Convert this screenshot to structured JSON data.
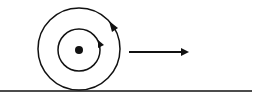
{
  "diagram": {
    "type": "rolling-wheel",
    "stroke_color": "#111111",
    "background": "#ffffff",
    "ground": {
      "x1": 0,
      "x2": 252,
      "y": 91
    },
    "outer_circle": {
      "cx": 79,
      "cy": 49,
      "r": 41,
      "rotation": "clockwise"
    },
    "inner_circle": {
      "cx": 79,
      "cy": 50,
      "r": 21,
      "rotation": "clockwise"
    },
    "center_dot": {
      "cx": 79,
      "cy": 50,
      "r": 4
    },
    "velocity_arrow": {
      "x1": 129,
      "x2": 188,
      "y": 52,
      "direction": "right"
    }
  }
}
